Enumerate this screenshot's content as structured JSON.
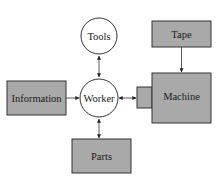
{
  "diagram": {
    "nodes": {
      "tools": {
        "label": "Tools",
        "shape": "circle"
      },
      "worker": {
        "label": "Worker",
        "shape": "circle"
      },
      "information": {
        "label": "Information",
        "shape": "box"
      },
      "parts": {
        "label": "Parts",
        "shape": "box"
      },
      "tape": {
        "label": "Tape",
        "shape": "box"
      },
      "machine": {
        "label": "Machine",
        "shape": "box-with-port"
      }
    },
    "edges": [
      {
        "from": "information",
        "to": "worker",
        "direction": "one-way"
      },
      {
        "from": "worker",
        "to": "tools",
        "direction": "two-way"
      },
      {
        "from": "worker",
        "to": "parts",
        "direction": "two-way"
      },
      {
        "from": "worker",
        "to": "machine",
        "direction": "two-way"
      },
      {
        "from": "tape",
        "to": "machine",
        "direction": "one-way"
      }
    ],
    "colors": {
      "box_fill": "#a9a9a9",
      "stroke": "#333333",
      "circle_fill": "#ffffff"
    }
  }
}
